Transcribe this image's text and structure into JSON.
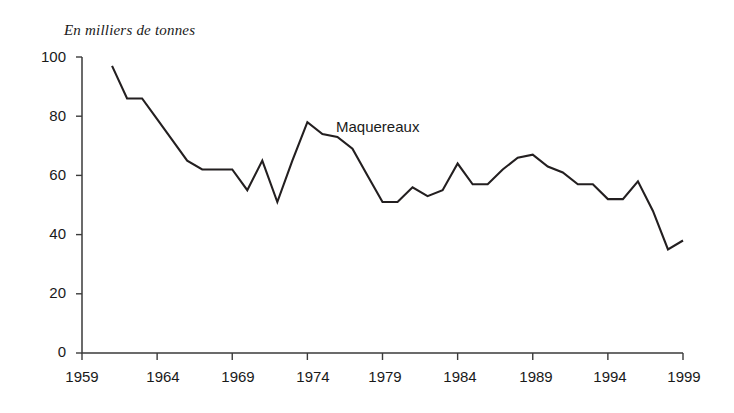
{
  "chart_data": {
    "type": "line",
    "title": "En milliers de tonnes",
    "subtitle": "",
    "xlabel": "",
    "ylabel": "En milliers de tonnes",
    "xlim": [
      1959,
      1999
    ],
    "ylim": [
      0,
      100
    ],
    "xticks": [
      1959,
      1964,
      1969,
      1974,
      1979,
      1984,
      1989,
      1994,
      1999
    ],
    "yticks": [
      0,
      20,
      40,
      60,
      80,
      100
    ],
    "xtick_labels": [
      "1959",
      "1964",
      "1969",
      "1974",
      "1979",
      "1984",
      "1989",
      "1994",
      "1999"
    ],
    "ytick_labels": [
      "0",
      "20",
      "40",
      "60",
      "80",
      "100"
    ],
    "grid": false,
    "legend": "inline-annotation",
    "annotations": [
      {
        "text": "Maquereaux",
        "x": 1977,
        "y": 75
      }
    ],
    "series": [
      {
        "name": "Maquereaux",
        "color": "#231f20",
        "x": [
          1961,
          1962,
          1963,
          1964,
          1965,
          1966,
          1967,
          1968,
          1969,
          1970,
          1971,
          1972,
          1973,
          1974,
          1975,
          1976,
          1977,
          1978,
          1979,
          1980,
          1981,
          1982,
          1983,
          1984,
          1985,
          1986,
          1987,
          1988,
          1989,
          1990,
          1991,
          1992,
          1993,
          1994,
          1995,
          1996,
          1997,
          1998,
          1999
        ],
        "y": [
          97,
          86,
          86,
          79,
          72,
          65,
          62,
          62,
          62,
          55,
          65,
          51,
          65,
          78,
          74,
          73,
          69,
          60,
          51,
          51,
          56,
          53,
          55,
          64,
          57,
          57,
          62,
          66,
          67,
          63,
          61,
          57,
          57,
          52,
          52,
          58,
          48,
          35,
          38
        ]
      }
    ]
  },
  "axis": {
    "title_text": "En milliers de tonnes",
    "series_label": "Maquereaux"
  }
}
